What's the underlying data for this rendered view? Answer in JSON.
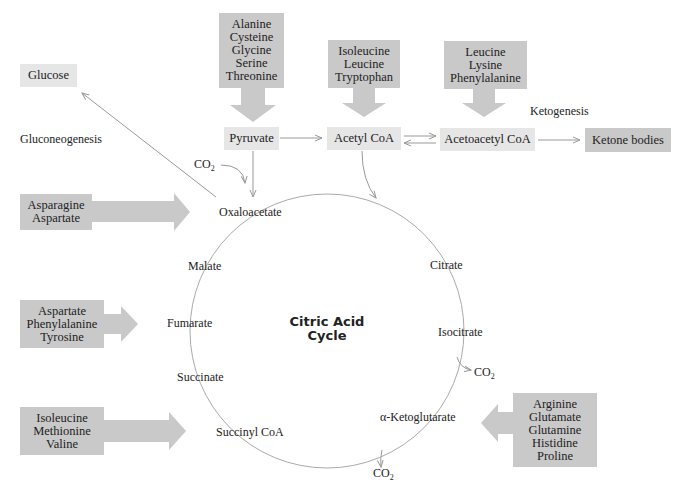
{
  "diagram": {
    "center_title": [
      "Citric Acid",
      "Cycle"
    ],
    "cycle_intermediates": [
      "Oxaloacetate",
      "Citrate",
      "Isocitrate",
      "α-Ketoglutarate",
      "Succinyl CoA",
      "Succinate",
      "Fumarate",
      "Malate"
    ],
    "nodes": {
      "glucose": "Glucose",
      "pyruvate": "Pyruvate",
      "acetyl_coa": "Acetyl CoA",
      "acetoacetyl_coa": "Acetoacetyl CoA",
      "ketone_bodies": "Ketone bodies"
    },
    "process_labels": {
      "gluconeogenesis": "Gluconeogenesis",
      "ketogenesis": "Ketogenesis"
    },
    "co2": "CO",
    "co2_sub": "2",
    "amino_acid_groups": {
      "to_pyruvate": [
        "Alanine",
        "Cysteine",
        "Glycine",
        "Serine",
        "Threonine"
      ],
      "to_acetyl_coa": [
        "Isoleucine",
        "Leucine",
        "Tryptophan"
      ],
      "to_acetoacetyl_coa": [
        "Leucine",
        "Lysine",
        "Phenylalanine"
      ],
      "to_oxaloacetate": [
        "Asparagine",
        "Aspartate"
      ],
      "to_fumarate": [
        "Aspartate",
        "Phenylalanine",
        "Tyrosine"
      ],
      "to_succinyl_coa": [
        "Isoleucine",
        "Methionine",
        "Valine"
      ],
      "to_alpha_ketoglutarate": [
        "Arginine",
        "Glutamate",
        "Glutamine",
        "Histidine",
        "Proline"
      ]
    },
    "colors": {
      "dark_box": "#c9c9c9",
      "light_box": "#e6e6e6",
      "arrow_line": "#999999",
      "text": "#222222"
    }
  }
}
